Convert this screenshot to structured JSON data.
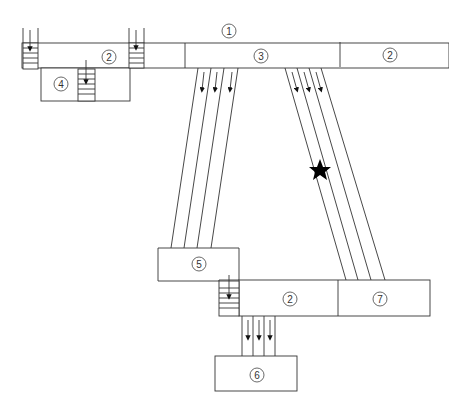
{
  "diagram": {
    "type": "floor-plan-flow",
    "labels": {
      "top_corridor": "1",
      "left_room": "2",
      "center_room": "3",
      "right_room": "2",
      "lower_left_room": "4",
      "mid_left_room": "5",
      "bottom_room": "6",
      "bottom_corridor": "2",
      "bottom_right_room": "7"
    },
    "marker": {
      "shape": "star",
      "color": "#000000"
    },
    "colors": {
      "line": "#333333",
      "background": "#ffffff",
      "fill": "#ffffff"
    }
  }
}
